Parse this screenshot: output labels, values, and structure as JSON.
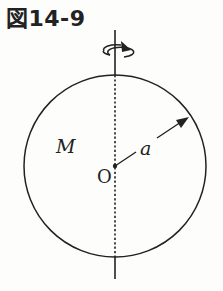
{
  "figure": {
    "title": "図14-9",
    "labels": {
      "mass": "M",
      "center": "O",
      "radius": "a"
    },
    "sphere": {
      "cx": 115,
      "cy": 166,
      "r": 91
    },
    "axis": {
      "x": 115,
      "y_top": 30,
      "y_bottom": 279
    },
    "colors": {
      "stroke": "#222222",
      "background": "#fdfdfb"
    }
  }
}
